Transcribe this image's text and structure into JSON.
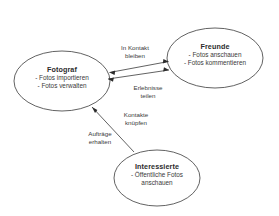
{
  "diagram": {
    "type": "use-case-actor-diagram",
    "language": "de",
    "background_color": "#ffffff",
    "stroke_color": "#3a3a3a",
    "text_color": "#2b2b2b",
    "nodes": [
      {
        "id": "fotograf",
        "title": "Fotograf",
        "lines": [
          "- Fotos importieren",
          "- Fotos verwalten"
        ],
        "shape": "ellipse",
        "cx": 62,
        "cy": 81,
        "rx": 48,
        "ry": 30
      },
      {
        "id": "freunde",
        "title": "Freunde",
        "lines": [
          "- Fotos anschauen",
          "- Fotos kommentieren"
        ],
        "shape": "ellipse",
        "cx": 215,
        "cy": 58,
        "rx": 48,
        "ry": 30
      },
      {
        "id": "interessierte",
        "title": "Interessierte",
        "lines": [
          "- Öffentliche Fotos",
          "anschauen"
        ],
        "shape": "ellipse",
        "cx": 157,
        "cy": 178,
        "rx": 43,
        "ry": 28
      }
    ],
    "edges": [
      {
        "id": "in-kontakt-bleiben",
        "from": "fotograf",
        "to": "freunde",
        "label_lines": [
          "In Kontakt",
          "bleiben"
        ],
        "direction": "bidirectional"
      },
      {
        "id": "erlebnisse-teilen",
        "from": "fotograf",
        "to": "freunde",
        "label_lines": [
          "Erlebnisse",
          "teilen"
        ],
        "direction": "bidirectional"
      },
      {
        "id": "kontakte-knuepfen",
        "from": "interessierte",
        "to": "fotograf",
        "label_lines": [
          "Kontakte",
          "knüpfen"
        ],
        "direction": "to-fotograf"
      },
      {
        "id": "auftraege-erhalten",
        "from": "interessierte",
        "to": "fotograf",
        "label_lines": [
          "Aufträge",
          "erhalten"
        ],
        "direction": "to-fotograf"
      }
    ]
  }
}
